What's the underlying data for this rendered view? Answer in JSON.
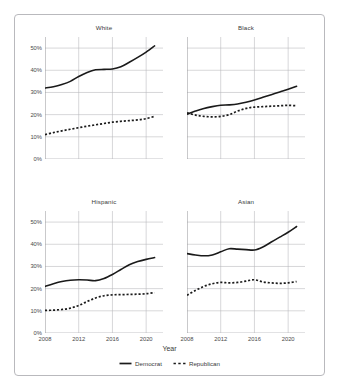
{
  "chart_data": {
    "type": "line",
    "title": "",
    "xlabel": "Year",
    "ylabel": "",
    "xlim": [
      2008,
      2022
    ],
    "ylim": [
      0,
      55
    ],
    "grid": true,
    "legend_position": "bottom-center",
    "xticks": [
      "2008",
      "2012",
      "2016",
      "2020"
    ],
    "xtick_values": [
      2008,
      2012,
      2016,
      2020
    ],
    "yticks": [
      "0%",
      "10%",
      "20%",
      "30%",
      "40%",
      "50%"
    ],
    "ytick_values": [
      0,
      10,
      20,
      30,
      40,
      50
    ],
    "legend": [
      {
        "name": "Democrat",
        "style": "solid"
      },
      {
        "name": "Republican",
        "style": "dotted"
      }
    ],
    "facets": [
      {
        "title": "White",
        "x": [
          2008,
          2009,
          2010,
          2011,
          2012,
          2013,
          2014,
          2015,
          2016,
          2017,
          2018,
          2019,
          2020,
          2021
        ],
        "series": [
          {
            "name": "Democrat",
            "style": "solid",
            "values": [
              32.0,
              32.6,
              33.6,
              35.0,
              37.2,
              39.0,
              40.2,
              40.4,
              40.6,
              41.6,
              43.6,
              45.8,
              48.2,
              51.0
            ]
          },
          {
            "name": "Republican",
            "style": "dotted",
            "values": [
              11.0,
              11.9,
              12.7,
              13.4,
              14.1,
              14.8,
              15.4,
              16.0,
              16.6,
              17.0,
              17.3,
              17.6,
              18.2,
              19.2
            ]
          }
        ]
      },
      {
        "title": "Black",
        "x": [
          2008,
          2009,
          2010,
          2011,
          2012,
          2013,
          2014,
          2015,
          2016,
          2017,
          2018,
          2019,
          2020,
          2021
        ],
        "series": [
          {
            "name": "Democrat",
            "style": "solid",
            "values": [
              20.2,
              21.6,
              22.8,
              23.6,
              24.2,
              24.4,
              24.8,
              25.6,
              26.6,
              27.8,
              29.0,
              30.2,
              31.4,
              32.8
            ]
          },
          {
            "name": "Republican",
            "style": "dotted",
            "values": [
              20.8,
              19.8,
              19.2,
              19.0,
              19.2,
              20.0,
              21.6,
              22.8,
              23.4,
              23.6,
              23.8,
              24.0,
              24.2,
              24.0
            ]
          }
        ]
      },
      {
        "title": "Hispanic",
        "x": [
          2008,
          2009,
          2010,
          2011,
          2012,
          2013,
          2014,
          2015,
          2016,
          2017,
          2018,
          2019,
          2020,
          2021
        ],
        "series": [
          {
            "name": "Democrat",
            "style": "solid",
            "values": [
              21.0,
              22.2,
              23.2,
              23.8,
              24.0,
              23.9,
              23.6,
              24.6,
              26.4,
              28.6,
              30.8,
              32.2,
              33.2,
              34.0
            ]
          },
          {
            "name": "Republican",
            "style": "dotted",
            "values": [
              10.2,
              10.3,
              10.6,
              11.2,
              12.4,
              14.2,
              15.8,
              16.8,
              17.2,
              17.3,
              17.4,
              17.5,
              17.7,
              18.2
            ]
          }
        ]
      },
      {
        "title": "Asian",
        "x": [
          2008,
          2009,
          2010,
          2011,
          2012,
          2013,
          2014,
          2015,
          2016,
          2017,
          2018,
          2019,
          2020,
          2021
        ],
        "series": [
          {
            "name": "Democrat",
            "style": "solid",
            "values": [
              35.8,
              35.2,
              34.8,
              35.2,
              36.6,
              38.0,
              37.8,
              37.6,
              37.4,
              38.8,
              41.0,
              43.2,
              45.4,
              48.0
            ]
          },
          {
            "name": "Republican",
            "style": "dotted",
            "values": [
              17.0,
              19.2,
              21.0,
              22.2,
              22.8,
              22.6,
              22.8,
              23.4,
              24.0,
              23.0,
              22.6,
              22.4,
              22.6,
              23.2
            ]
          }
        ]
      }
    ]
  },
  "colors": {
    "line": "#1a1a1a",
    "grid": "#b6b6ba",
    "axis": "#8c8c90",
    "frame": "#b9b9bd",
    "text": "#3d3d3d",
    "background": "#ffffff"
  }
}
